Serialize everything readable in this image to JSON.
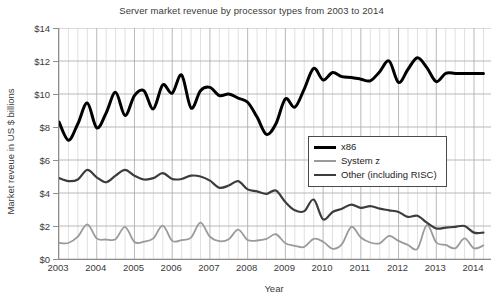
{
  "chart_data": {
    "type": "line",
    "title": "Server market revenue by processor types from 2003 to 2014",
    "xlabel": "Year",
    "ylabel": "Market reveue in US $ billions",
    "ylim": [
      0,
      14
    ],
    "y_ticks": [
      "$0",
      "$2",
      "$4",
      "$6",
      "$8",
      "$10",
      "$12",
      "$14"
    ],
    "y_tick_values": [
      0,
      2,
      4,
      6,
      8,
      10,
      12,
      14
    ],
    "x_tick_labels": [
      "2003",
      "2004",
      "2005",
      "2006",
      "2007",
      "2008",
      "2009",
      "2010",
      "2011",
      "2012",
      "2013",
      "2014"
    ],
    "x_tick_values": [
      2003,
      2004,
      2005,
      2006,
      2007,
      2008,
      2009,
      2010,
      2011,
      2012,
      2013,
      2014
    ],
    "xlim": [
      2003,
      2014.45
    ],
    "grid": "both-quarterly-vertical-and-2unit-horizontal",
    "legend_position": "center-right-inside",
    "x": [
      2003.0,
      2003.25,
      2003.5,
      2003.75,
      2004.0,
      2004.25,
      2004.5,
      2004.75,
      2005.0,
      2005.25,
      2005.5,
      2005.75,
      2006.0,
      2006.25,
      2006.5,
      2006.75,
      2007.0,
      2007.25,
      2007.5,
      2007.75,
      2008.0,
      2008.25,
      2008.5,
      2008.75,
      2009.0,
      2009.25,
      2009.5,
      2009.75,
      2010.0,
      2010.25,
      2010.5,
      2010.75,
      2011.0,
      2011.25,
      2011.5,
      2011.75,
      2012.0,
      2012.25,
      2012.5,
      2012.75,
      2013.0,
      2013.25,
      2013.5,
      2013.75,
      2014.0,
      2014.25
    ],
    "series": [
      {
        "name": "x86",
        "color": "#000000",
        "width": 3.0,
        "values": [
          8.3,
          7.2,
          8.2,
          9.45,
          7.95,
          8.85,
          10.1,
          8.7,
          9.9,
          10.2,
          9.1,
          10.55,
          10.05,
          11.15,
          9.15,
          10.2,
          10.4,
          9.9,
          10.0,
          9.75,
          9.5,
          8.6,
          7.55,
          8.2,
          9.7,
          9.2,
          10.3,
          11.55,
          10.85,
          11.3,
          11.05,
          11.0,
          10.9,
          10.8,
          11.35,
          12.0,
          10.7,
          11.5,
          12.2,
          11.6,
          10.75,
          11.25,
          11.25,
          11.25,
          11.25,
          11.25
        ]
      },
      {
        "name": "System z",
        "color": "#9a9a9a",
        "width": 1.8,
        "values": [
          0.98,
          0.97,
          1.35,
          2.1,
          1.25,
          1.18,
          1.2,
          1.95,
          1.03,
          1.05,
          1.25,
          2.02,
          1.1,
          1.15,
          1.3,
          2.2,
          1.35,
          1.08,
          1.2,
          1.78,
          1.15,
          1.12,
          1.22,
          1.5,
          0.95,
          0.8,
          0.73,
          1.22,
          1.05,
          0.62,
          0.9,
          1.95,
          1.3,
          1.0,
          0.95,
          1.4,
          1.1,
          0.85,
          0.62,
          2.05,
          1.0,
          0.85,
          0.65,
          1.25,
          0.65,
          0.82
        ]
      },
      {
        "name": "Other (including RISC)",
        "color": "#3c3c3c",
        "width": 2.2,
        "values": [
          4.9,
          4.72,
          4.82,
          5.4,
          4.95,
          4.65,
          5.05,
          5.4,
          5.05,
          4.82,
          4.9,
          5.2,
          4.85,
          4.85,
          5.05,
          5.0,
          4.75,
          4.32,
          4.45,
          4.72,
          4.22,
          4.1,
          3.95,
          4.15,
          3.45,
          2.95,
          2.9,
          3.6,
          2.4,
          2.85,
          3.05,
          3.3,
          3.1,
          3.2,
          3.05,
          2.95,
          2.85,
          2.55,
          2.62,
          2.2,
          1.85,
          1.9,
          1.95,
          2.0,
          1.6,
          1.6
        ]
      }
    ],
    "legend": [
      {
        "label": "x86",
        "color": "#000000",
        "width": 3.0
      },
      {
        "label": "System z",
        "color": "#9a9a9a",
        "width": 1.8
      },
      {
        "label": "Other (including RISC)",
        "color": "#3c3c3c",
        "width": 2.2
      }
    ],
    "grid_color": "#bdbdbd",
    "axis_color": "#8d8d8d",
    "background": "#ffffff"
  }
}
